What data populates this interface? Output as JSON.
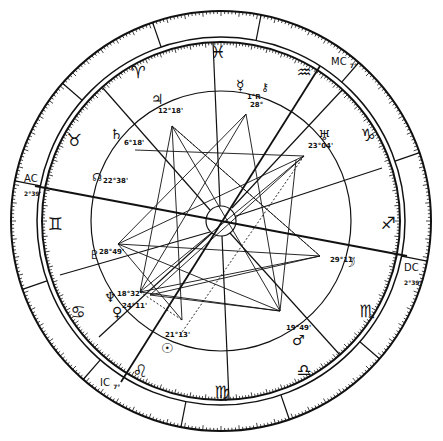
{
  "chart": {
    "type": "natal-chart-wheel",
    "center": [
      221,
      221
    ],
    "colors": {
      "ink": "#111111",
      "background": "#ffffff"
    }
  },
  "angles": {
    "ac": {
      "label": "AC",
      "degree": "2°39'"
    },
    "mc": {
      "label": "MC",
      "degree": "7°"
    },
    "dc": {
      "label": "DC",
      "degree": "2°39'"
    },
    "ic": {
      "label": "IC",
      "degree": "7°"
    }
  },
  "signs": [
    {
      "name": "aries",
      "glyph": "♈"
    },
    {
      "name": "pisces",
      "glyph": "♓"
    },
    {
      "name": "aquarius",
      "glyph": "♒"
    },
    {
      "name": "capricorn",
      "glyph": "♑"
    },
    {
      "name": "sagittarius",
      "glyph": "♐"
    },
    {
      "name": "scorpio",
      "glyph": "♏"
    },
    {
      "name": "libra",
      "glyph": "♎"
    },
    {
      "name": "virgo",
      "glyph": "♍"
    },
    {
      "name": "leo",
      "glyph": "♌"
    },
    {
      "name": "cancer",
      "glyph": "♋"
    },
    {
      "name": "gemini",
      "glyph": "♊"
    },
    {
      "name": "taurus",
      "glyph": "♉"
    }
  ],
  "planets": [
    {
      "name": "jupiter",
      "glyph": "♃",
      "degree": "12°18'"
    },
    {
      "name": "mercury",
      "glyph": "☿",
      "degree": "1°R"
    },
    {
      "name": "chiron",
      "glyph": "⚷",
      "degree": "28°"
    },
    {
      "name": "uranus",
      "glyph": "♅",
      "degree": "23°04'"
    },
    {
      "name": "saturn",
      "glyph": "♄",
      "degree": "6°18'"
    },
    {
      "name": "north-node",
      "glyph": "☊",
      "degree": "22°38'"
    },
    {
      "name": "pluto",
      "glyph": "♇",
      "degree": "28°49'"
    },
    {
      "name": "neptune",
      "glyph": "♆",
      "degree": "18°32'"
    },
    {
      "name": "venus",
      "glyph": "♀",
      "degree": "24°11'"
    },
    {
      "name": "sun",
      "glyph": "☉",
      "degree": "21°13'"
    },
    {
      "name": "mars",
      "glyph": "♂",
      "degree": "19°49'"
    },
    {
      "name": "moon",
      "glyph": "☽",
      "degree": "29°11'"
    }
  ]
}
